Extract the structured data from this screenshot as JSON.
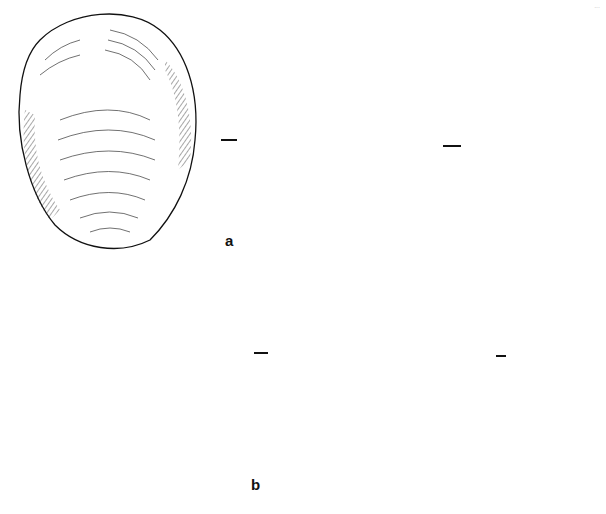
{
  "page": {
    "page_number": "..."
  },
  "figure": {
    "rows": [
      {
        "label": "a",
        "views": [
          "ventral face",
          "dorsal face",
          "profile"
        ]
      },
      {
        "label": "b",
        "views": [
          "ventral face",
          "dorsal face",
          "profile"
        ]
      }
    ],
    "colors": {
      "ink": "#111111",
      "paper": "#ffffff"
    }
  }
}
